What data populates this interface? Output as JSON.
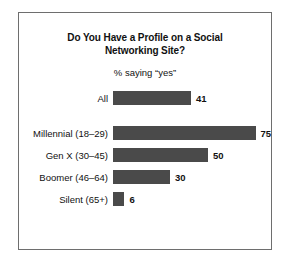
{
  "chart_data": {
    "type": "bar",
    "orientation": "horizontal",
    "title": "Do You Have a Profile on a Social Networking Site?",
    "title_line1": "Do You Have a Profile on a Social",
    "title_line2": "Networking Site?",
    "subtitle": "% saying “yes”",
    "xlabel": "",
    "ylabel": "",
    "xlim": [
      0,
      100
    ],
    "grid": false,
    "legend": false,
    "bar_color": "#4a4a4a",
    "frame_color": "#6e6e6e",
    "background": "#ffffff",
    "categories": [
      "All",
      "Millennial (18–29)",
      "Gen X (30–45)",
      "Boomer (46–64)",
      "Silent (65+)"
    ],
    "values": [
      41,
      75,
      50,
      30,
      6
    ],
    "value_labels": [
      "41",
      "75",
      "50",
      "30",
      "6"
    ],
    "bars": [
      {
        "label": "All",
        "value": 41,
        "value_label": "41",
        "separated": true
      },
      {
        "label": "Millennial (18–29)",
        "value": 75,
        "value_label": "75",
        "separated": false
      },
      {
        "label": "Gen X (30–45)",
        "value": 50,
        "value_label": "50",
        "separated": false
      },
      {
        "label": "Boomer (46–64)",
        "value": 30,
        "value_label": "30",
        "separated": false
      },
      {
        "label": "Silent (65+)",
        "value": 6,
        "value_label": "6",
        "separated": false
      }
    ]
  }
}
